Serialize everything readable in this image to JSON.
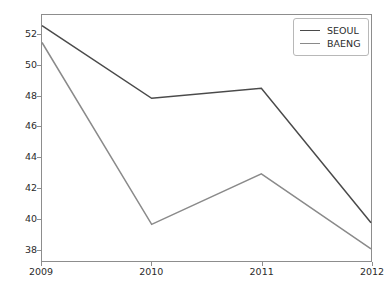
{
  "chart_data": {
    "type": "line",
    "title": "",
    "xlabel": "",
    "ylabel": "",
    "x": [
      2009,
      2010,
      2011,
      2012
    ],
    "categories": [
      "2009",
      "2010",
      "2011",
      "2012"
    ],
    "xtick_labels": [
      "2009",
      "2010",
      "2011",
      "2012"
    ],
    "ytick_labels": [
      "38",
      "40",
      "42",
      "44",
      "46",
      "48",
      "50",
      "52"
    ],
    "yticks": [
      38,
      40,
      42,
      44,
      46,
      48,
      50,
      52
    ],
    "xlim": [
      2009,
      2012
    ],
    "ylim": [
      37.2,
      53.3
    ],
    "grid": false,
    "legend_position": "upper right",
    "series": [
      {
        "name": "SEOUL",
        "color": "#4a4a4a",
        "values": [
          52.6,
          47.85,
          48.5,
          39.7
        ]
      },
      {
        "name": "BAENG",
        "color": "#8a8a8a",
        "values": [
          51.5,
          39.6,
          42.9,
          38.0
        ]
      }
    ]
  },
  "axes": {
    "frame_color": "#8d8d8d",
    "tick_color": "#2b2b2b"
  },
  "legend": {
    "entries": [
      {
        "label": "SEOUL",
        "color": "#4a4a4a"
      },
      {
        "label": "BAENG",
        "color": "#8a8a8a"
      }
    ]
  }
}
